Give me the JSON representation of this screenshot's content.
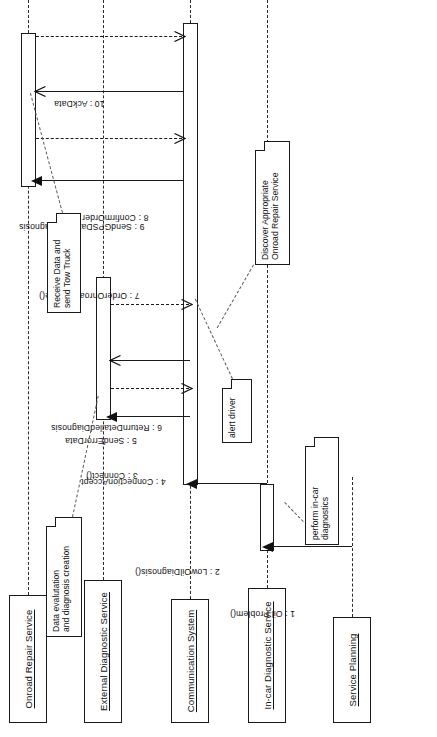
{
  "diagram": {
    "type": "uml-sequence-diagram",
    "orientation": "rotated-90-ccw",
    "line_color": "#1a1a1a",
    "background_color": "#ffffff"
  },
  "lifelines": [
    {
      "id": "service-planning",
      "label": "Service  Planning"
    },
    {
      "id": "in-car-diagnostic-service",
      "label": "In-car Diagnostic Service"
    },
    {
      "id": "communication-system",
      "label": "Communication System"
    },
    {
      "id": "external-diagnostic-service",
      "label": "External Diagnostic Service"
    },
    {
      "id": "onroad-repair-service",
      "label": "Onroad Repair Service"
    }
  ],
  "messages": [
    {
      "seq": "1",
      "label": "1 : Oil Problem()",
      "from": "service-planning",
      "to": "in-car-diagnostic-service",
      "style": "solid",
      "arrow": "filled"
    },
    {
      "seq": "2",
      "label": "2 : LowOilDiagnosis()",
      "from": "in-car-diagnostic-service",
      "to": "communication-system",
      "style": "solid",
      "arrow": "filled"
    },
    {
      "seq": "3",
      "label": "3 : Connect()",
      "from": "communication-system",
      "to": "external-diagnostic-service",
      "style": "solid",
      "arrow": "filled"
    },
    {
      "seq": "4",
      "label": "4 : ConnectionAccept",
      "from": "external-diagnostic-service",
      "to": "communication-system",
      "style": "dashed",
      "arrow": "open"
    },
    {
      "seq": "5",
      "label": "5 : SendErrorData",
      "from": "communication-system",
      "to": "external-diagnostic-service",
      "style": "solid",
      "arrow": "open"
    },
    {
      "seq": "6",
      "label": "6 : ReturnDetailedDiagnosis",
      "from": "external-diagnostic-service",
      "to": "communication-system",
      "style": "dashed",
      "arrow": "open"
    },
    {
      "seq": "7",
      "label": "7 : OrderOnroadService()",
      "from": "communication-system",
      "to": "onroad-repair-service",
      "style": "solid",
      "arrow": "filled"
    },
    {
      "seq": "8",
      "label": "8 : ConfirmOrder",
      "from": "onroad-repair-service",
      "to": "communication-system",
      "style": "dashed",
      "arrow": "open"
    },
    {
      "seq": "9",
      "label": "9 : SendGPSDataAndDiagnosis",
      "from": "communication-system",
      "to": "onroad-repair-service",
      "style": "solid",
      "arrow": "open"
    },
    {
      "seq": "10",
      "label": "10 : AckData",
      "from": "onroad-repair-service",
      "to": "communication-system",
      "style": "dashed",
      "arrow": "open"
    }
  ],
  "notes": [
    {
      "id": "note-perform-in-car-diagnostics",
      "text": "perform in-car\ndiagnostics",
      "attached_to": "in-car-diagnostic-service"
    },
    {
      "id": "note-alert-driver",
      "text": "alert driver",
      "attached_to": "communication-system"
    },
    {
      "id": "note-data-evaluation",
      "text": "Data evalutation\nand diagnosis creation",
      "attached_to": "external-diagnostic-service"
    },
    {
      "id": "note-receive-data",
      "text": "Receive Data and\nsend Tow Truck",
      "attached_to": "onroad-repair-service"
    },
    {
      "id": "note-discover-service",
      "text": "Discover Appropriate\nOnroad Repair Service",
      "attached_to": "communication-system"
    }
  ]
}
